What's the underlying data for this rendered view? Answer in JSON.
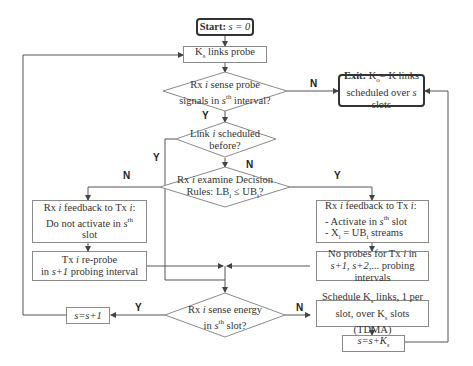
{
  "diagram": {
    "type": "flowchart",
    "nodes": {
      "start": {
        "bold": "Start:",
        "text": " s = 0"
      },
      "probe": {
        "text": "K links probe",
        "sub": "s"
      },
      "sense_probe": {
        "line1": "Rx i sense probe",
        "line2": "signals in s^th interval?"
      },
      "exit": {
        "bold": "Exit:",
        "line1": " K = K links",
        "line2": "scheduled over s slots"
      },
      "scheduled_before": {
        "line1": "Link i scheduled",
        "line2": "before?"
      },
      "decision_rules": {
        "line1": "Rx i examine Decision",
        "line2": "Rules: LB ≤ UB ?"
      },
      "feedback_no": {
        "line1": "Rx i feedback to Tx i:",
        "line2": "Do not activate in s^th",
        "line3": "slot"
      },
      "feedback_yes": {
        "line1": "Rx i feedback to Tx i:",
        "line2": "- Activate in s^th slot",
        "line3": "- X = UB streams"
      },
      "reprobe": {
        "line1": "Tx i re-probe",
        "line2": "in s+1 probing interval"
      },
      "no_probes": {
        "line1": "No probes for Tx i in",
        "line2": "s+1, s+2,... probing intervals"
      },
      "sense_energy": {
        "line1": "Rx i sense energy",
        "line2": "in s^th slot?"
      },
      "increment": {
        "text": "s=s+1"
      },
      "schedule_tdma": {
        "line1": "Schedule K links, 1 per",
        "line2": "slot, over K slots (TDMA)"
      },
      "increment_ks": {
        "text": "s=s+K"
      }
    },
    "edge_labels": {
      "sense_probe_no": "N",
      "sense_probe_yes": "Y",
      "scheduled_yes": "Y",
      "scheduled_no": "N",
      "rules_no": "N",
      "rules_yes": "Y",
      "energy_yes": "Y",
      "energy_no": "N"
    },
    "colors": {
      "line": "#555555",
      "border": "#8a8a8a",
      "text": "#333333"
    }
  }
}
